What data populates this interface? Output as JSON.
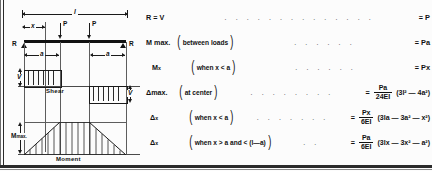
{
  "card": {
    "title": "Simple beam - two equal concentrated loads symmetrically placed"
  },
  "diagram": {
    "beam": {
      "span_label": "l",
      "dim_x_label": "x",
      "load_left_label": "P",
      "load_right_label": "P",
      "reaction_left_label": "R",
      "reaction_right_label": "R",
      "dim_a_left_label": "a",
      "dim_a_right_label": "a"
    },
    "shear": {
      "caption": "Shear",
      "v_left_label": "V",
      "v_right_label": "V"
    },
    "moment": {
      "caption": "Moment",
      "m_max_label": "M",
      "m_max_sub": "max."
    }
  },
  "formulas": {
    "leader_dots": ". . . . . . . . . . . . . .",
    "rows": [
      {
        "name": "R = V",
        "name_sub": "",
        "condition": "",
        "has_paren": false,
        "leader": ". . . . . . . . . . . . . .",
        "equals": "=",
        "result": "P",
        "frac_num": "",
        "frac_den": "",
        "tail": ""
      },
      {
        "name": "M max.",
        "name_sub": "",
        "condition": "between loads",
        "has_paren": true,
        "leader": ". . . . . .",
        "equals": "=",
        "result": "Pa",
        "frac_num": "",
        "frac_den": "",
        "tail": ""
      },
      {
        "name": "M",
        "name_sub": "x",
        "condition": "when x < a",
        "has_paren": true,
        "leader": ". . . . . .",
        "equals": "=",
        "result": "Px",
        "frac_num": "",
        "frac_den": "",
        "tail": ""
      },
      {
        "name": "Δmax.",
        "name_sub": "",
        "condition": "at center",
        "has_paren": true,
        "leader": ". . . . . . . .",
        "equals": "=",
        "result": "",
        "frac_num": "Pa",
        "frac_den": "24EI",
        "tail": "(3l² — 4a²)"
      },
      {
        "name": "Δ",
        "name_sub": "x",
        "condition": "when x < a",
        "has_paren": true,
        "leader": ". . . . . . .",
        "equals": "=",
        "result": "",
        "frac_num": "Px",
        "frac_den": "6EI",
        "tail": "(3la — 3a² — x²)"
      },
      {
        "name": "Δ",
        "name_sub": "x",
        "condition": "when x > a and < (l—a)",
        "has_paren": true,
        "leader": ". .",
        "equals": "=",
        "result": "",
        "frac_num": "Pa",
        "frac_den": "6EI",
        "tail": "(3lx — 3x² — a²)"
      }
    ]
  },
  "colors": {
    "ink": "#111111",
    "rule": "#2b2b2b",
    "paper": "#fcfcfc"
  }
}
